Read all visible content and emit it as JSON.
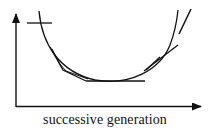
{
  "diagram": {
    "title": "",
    "x_axis": {
      "label": "successive generation",
      "arrow": true
    },
    "y_axis": {
      "label": "",
      "arrow": true
    },
    "curve": {
      "shape": "U-shaped convex curve",
      "description": "Smooth curve descending from upper left, reaching a minimum near the center-bottom, then rising steeply to upper right"
    },
    "tangent_segments": [
      {
        "name": "start-crosshair",
        "description": "Short horizontal line crossing the curve near its upper-left start"
      },
      {
        "name": "left-chord",
        "description": "Polygonal line segments closely following the curve on the descending left side"
      },
      {
        "name": "bottom-tangent",
        "description": "Horizontal line tangent to the curve at its minimum, extending right"
      },
      {
        "name": "right-chord",
        "description": "Line segments crossing the curve on the rising right side"
      },
      {
        "name": "upper-right-tangent",
        "description": "Steep line segment next to the curve at upper right"
      }
    ],
    "colors": {
      "stroke": "#111111",
      "background": "#ffffff"
    }
  }
}
